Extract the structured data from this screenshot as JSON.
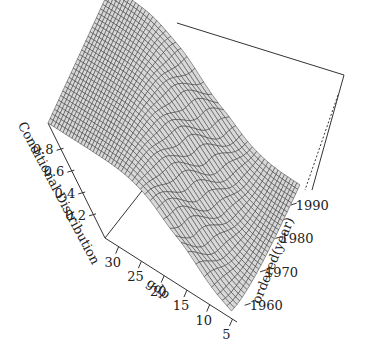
{
  "chart_data": {
    "type": "surface3d",
    "title": "",
    "xlabel": "gdp",
    "ylabel": "ordered(year)",
    "zlabel": "Conditional Distribution",
    "x_ticks": [
      "5",
      "10",
      "15",
      "20",
      "25",
      "30"
    ],
    "y_ticks": [
      "1960",
      "1970",
      "1980",
      "1990"
    ],
    "z_ticks": [
      "0.2",
      "0.4",
      "0.6",
      "0.8"
    ],
    "xlim": [
      4,
      33
    ],
    "ylim": [
      1955,
      1996
    ],
    "zlim": [
      0,
      1
    ],
    "grid": false,
    "legend": "none"
  }
}
